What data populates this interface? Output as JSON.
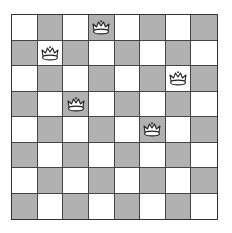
{
  "board": {
    "rows": 8,
    "cols": 8,
    "top_left_color": "light",
    "colors": {
      "light": "#ffffff",
      "dark": "#b8b8b8",
      "grid": "#444444"
    },
    "queens": [
      {
        "row": 0,
        "col": 3,
        "icon": "queen-crown-icon"
      },
      {
        "row": 1,
        "col": 1,
        "icon": "queen-crown-icon"
      },
      {
        "row": 2,
        "col": 6,
        "icon": "queen-crown-icon"
      },
      {
        "row": 3,
        "col": 2,
        "icon": "queen-crown-icon"
      },
      {
        "row": 4,
        "col": 5,
        "icon": "queen-crown-icon"
      }
    ]
  }
}
